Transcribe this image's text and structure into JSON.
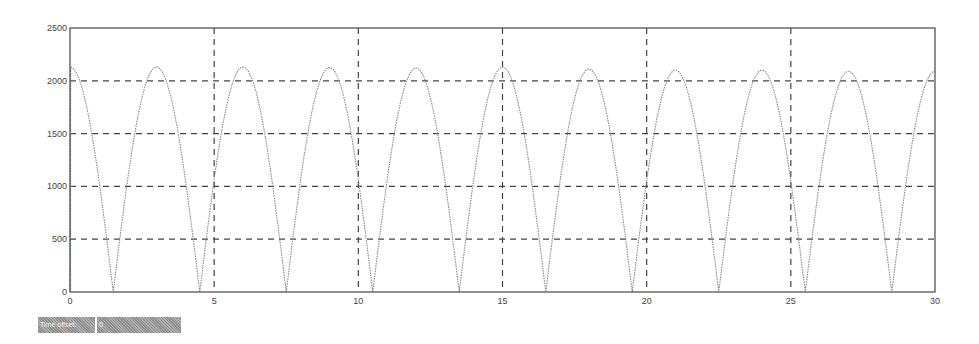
{
  "status": {
    "time_offset_label": "Time offset:",
    "time_offset_value": "0"
  },
  "colors": {
    "frame": "#555555",
    "grid": "#444444",
    "trace": "#888888",
    "status_bg": "#9a9a9a"
  },
  "chart_data": {
    "type": "line",
    "title": "",
    "xlabel": "",
    "ylabel": "",
    "xlim": [
      0,
      30
    ],
    "ylim": [
      0,
      2500
    ],
    "grid": true,
    "grid_style": "dashed",
    "legend": null,
    "x_ticks": [
      0,
      5,
      10,
      15,
      20,
      25,
      30
    ],
    "y_ticks": [
      0,
      500,
      1000,
      1500,
      2000,
      2500
    ],
    "x_tick_labels": [
      "0",
      "5",
      "10",
      "15",
      "20",
      "25",
      "30"
    ],
    "y_tick_labels": [
      "0",
      "500",
      "1000",
      "1500",
      "2000",
      "2500"
    ],
    "series": [
      {
        "name": "signal",
        "style": "dotted",
        "description": "Rectified sinusoid |A·cos(pi·t/3)|, period ≈ 3, peaks ≈ 2100–2130, troughs at 0",
        "peaks": [
          {
            "x": 0.1,
            "y": 2130
          },
          {
            "x": 3.0,
            "y": 2130
          },
          {
            "x": 6.0,
            "y": 2130
          },
          {
            "x": 9.0,
            "y": 2125
          },
          {
            "x": 12.0,
            "y": 2120
          },
          {
            "x": 15.0,
            "y": 2130
          },
          {
            "x": 18.0,
            "y": 2110
          },
          {
            "x": 21.0,
            "y": 2100
          },
          {
            "x": 24.0,
            "y": 2100
          },
          {
            "x": 27.0,
            "y": 2090
          }
        ],
        "troughs": [
          {
            "x": 1.5,
            "y": 0
          },
          {
            "x": 4.5,
            "y": 0
          },
          {
            "x": 7.5,
            "y": 0
          },
          {
            "x": 10.5,
            "y": 0
          },
          {
            "x": 13.5,
            "y": 0
          },
          {
            "x": 16.5,
            "y": 0
          },
          {
            "x": 19.5,
            "y": 0
          },
          {
            "x": 22.5,
            "y": 0
          },
          {
            "x": 25.5,
            "y": 0
          },
          {
            "x": 28.5,
            "y": 0
          }
        ],
        "end_point": {
          "x": 30,
          "y": 2080
        },
        "start_point": {
          "x": 0,
          "y": 0
        }
      }
    ]
  }
}
